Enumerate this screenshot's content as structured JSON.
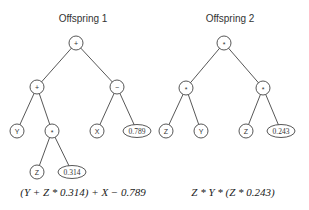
{
  "trees": [
    {
      "title": "Offspring 1",
      "title_pos": [
        83,
        22
      ],
      "expression": "(Y + Z * 0.314) + X − 0.789",
      "expr_pos": [
        83,
        196
      ],
      "nodes": [
        {
          "id": "r",
          "label": "+",
          "x": 76,
          "y": 43,
          "kind": "op"
        },
        {
          "id": "a",
          "label": "+",
          "x": 37,
          "y": 87,
          "kind": "op"
        },
        {
          "id": "b",
          "label": "−",
          "x": 117,
          "y": 87,
          "kind": "op"
        },
        {
          "id": "c",
          "label": "Y",
          "x": 17,
          "y": 131,
          "kind": "var"
        },
        {
          "id": "d",
          "label": "*",
          "x": 52,
          "y": 131,
          "kind": "op"
        },
        {
          "id": "e",
          "label": "X",
          "x": 97,
          "y": 131,
          "kind": "var"
        },
        {
          "id": "f",
          "label": "0.789",
          "x": 137,
          "y": 131,
          "kind": "const"
        },
        {
          "id": "g",
          "label": "Z",
          "x": 37,
          "y": 172,
          "kind": "var"
        },
        {
          "id": "h",
          "label": "0.314",
          "x": 72,
          "y": 172,
          "kind": "const"
        }
      ],
      "edges": [
        [
          "r",
          "a"
        ],
        [
          "r",
          "b"
        ],
        [
          "a",
          "c"
        ],
        [
          "a",
          "d"
        ],
        [
          "b",
          "e"
        ],
        [
          "b",
          "f"
        ],
        [
          "d",
          "g"
        ],
        [
          "d",
          "h"
        ]
      ]
    },
    {
      "title": "Offspring 2",
      "title_pos": [
        230,
        22
      ],
      "expression": "Z * Y * (Z * 0.243)",
      "expr_pos": [
        233,
        196
      ],
      "nodes": [
        {
          "id": "r",
          "label": "*",
          "x": 224,
          "y": 43,
          "kind": "op"
        },
        {
          "id": "a",
          "label": "*",
          "x": 186,
          "y": 88,
          "kind": "op"
        },
        {
          "id": "b",
          "label": "*",
          "x": 263,
          "y": 88,
          "kind": "op"
        },
        {
          "id": "c",
          "label": "Z",
          "x": 166,
          "y": 131,
          "kind": "var"
        },
        {
          "id": "d",
          "label": "Y",
          "x": 201,
          "y": 131,
          "kind": "var"
        },
        {
          "id": "e",
          "label": "Z",
          "x": 246,
          "y": 131,
          "kind": "var"
        },
        {
          "id": "f",
          "label": "0.243",
          "x": 281,
          "y": 131,
          "kind": "const"
        }
      ],
      "edges": [
        [
          "r",
          "a"
        ],
        [
          "r",
          "b"
        ],
        [
          "a",
          "c"
        ],
        [
          "a",
          "d"
        ],
        [
          "b",
          "e"
        ],
        [
          "b",
          "f"
        ]
      ]
    }
  ]
}
